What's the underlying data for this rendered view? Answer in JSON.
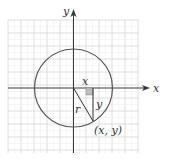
{
  "diagram": {
    "type": "circle-on-coordinate-plane",
    "labels": {
      "x_axis": "x",
      "y_axis": "y",
      "horizontal_leg": "x",
      "vertical_leg": "y",
      "radius": "r",
      "point": "(x, y)"
    },
    "colors": {
      "axis": "#3a3a3a",
      "circle": "#555555",
      "grid_major": "#d6d6d6",
      "grid_minor": "#ececec",
      "right_angle_box": "#bdbdbd"
    },
    "geometry": {
      "origin": [
        73.5,
        88
      ],
      "radius_px": 39,
      "point": [
        93,
        121
      ],
      "grid_bounds": [
        8,
        20,
        139,
        153
      ],
      "grid_major_step": 13
    }
  }
}
